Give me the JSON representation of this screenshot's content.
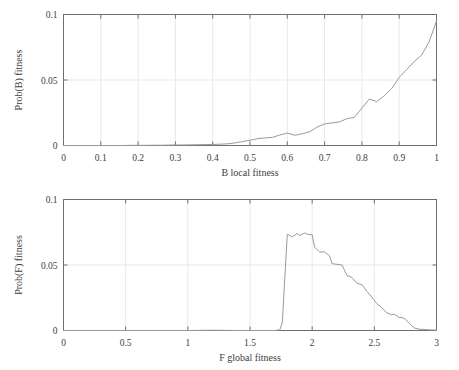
{
  "figure": {
    "background": "#ffffff",
    "line_color": "#9a9a9a",
    "axis_color": "#6f6f6f",
    "grid_color": "#e8e8e8",
    "text_color": "#3d3d3d"
  },
  "chart_data": [
    {
      "type": "line",
      "id": "b-local-fitness",
      "title": "",
      "xlabel": "B local fitness",
      "ylabel": "Prob(B) fitness",
      "xlim": [
        0,
        1
      ],
      "ylim": [
        0,
        0.1
      ],
      "xticks": [
        0,
        0.1,
        0.2,
        0.3,
        0.4,
        0.5,
        0.6,
        0.7,
        0.8,
        0.9,
        1
      ],
      "xticklabels": [
        "0",
        "0.1",
        "0.2",
        "0.3",
        "0.4",
        "0.5",
        "0.6",
        "0.7",
        "0.8",
        "0.9",
        "1"
      ],
      "yticks": [
        0,
        0.05,
        0.1
      ],
      "yticklabels": [
        "0",
        "0.05",
        "0.1"
      ],
      "grid": true,
      "legend": "none",
      "x": [
        0.0,
        0.02,
        0.04,
        0.06,
        0.08,
        0.1,
        0.12,
        0.14,
        0.16,
        0.18,
        0.2,
        0.22,
        0.24,
        0.26,
        0.28,
        0.3,
        0.32,
        0.34,
        0.36,
        0.38,
        0.4,
        0.42,
        0.44,
        0.46,
        0.48,
        0.5,
        0.52,
        0.54,
        0.56,
        0.58,
        0.6,
        0.62,
        0.64,
        0.66,
        0.68,
        0.7,
        0.72,
        0.74,
        0.76,
        0.78,
        0.8,
        0.82,
        0.84,
        0.86,
        0.88,
        0.9,
        0.92,
        0.94,
        0.96,
        0.98,
        1.0
      ],
      "y": [
        0.0,
        0.0,
        0.0,
        0.0,
        0.0,
        0.0,
        0.0,
        0.0,
        0.0,
        0.0001,
        0.0001,
        0.0001,
        0.0002,
        0.0002,
        0.0003,
        0.0004,
        0.0004,
        0.0005,
        0.0006,
        0.0007,
        0.0008,
        0.001,
        0.0013,
        0.002,
        0.003,
        0.004,
        0.0052,
        0.0058,
        0.0062,
        0.008,
        0.0095,
        0.0078,
        0.009,
        0.0105,
        0.014,
        0.0165,
        0.0172,
        0.018,
        0.0205,
        0.0215,
        0.0285,
        0.0355,
        0.0335,
        0.038,
        0.0435,
        0.052,
        0.058,
        0.064,
        0.069,
        0.079,
        0.095
      ]
    },
    {
      "type": "line",
      "id": "f-global-fitness",
      "title": "",
      "xlabel": "F global fitness",
      "ylabel": "Prob(F) fitness",
      "xlim": [
        0,
        3
      ],
      "ylim": [
        0,
        0.1
      ],
      "xticks": [
        0,
        0.5,
        1,
        1.5,
        2,
        2.5,
        3
      ],
      "xticklabels": [
        "0",
        "0.5",
        "1",
        "1.5",
        "2",
        "2.5",
        "3"
      ],
      "yticks": [
        0,
        0.05,
        0.1
      ],
      "yticklabels": [
        "0",
        "0.05",
        "0.1"
      ],
      "grid": true,
      "legend": "none",
      "x": [
        0.0,
        0.2,
        0.4,
        0.6,
        0.8,
        1.0,
        1.2,
        1.4,
        1.6,
        1.7,
        1.74,
        1.76,
        1.78,
        1.8,
        1.84,
        1.88,
        1.9,
        1.94,
        1.96,
        2.0,
        2.02,
        2.06,
        2.1,
        2.14,
        2.16,
        2.2,
        2.24,
        2.28,
        2.32,
        2.36,
        2.4,
        2.44,
        2.48,
        2.52,
        2.56,
        2.6,
        2.64,
        2.66,
        2.7,
        2.74,
        2.78,
        2.82,
        2.86,
        2.9,
        2.94,
        3.0
      ],
      "y": [
        0.0,
        0.0,
        0.0,
        0.0,
        0.0,
        0.0,
        0.0002,
        0.0,
        0.0,
        0.0,
        0.0005,
        0.006,
        0.04,
        0.0735,
        0.0715,
        0.074,
        0.0725,
        0.0745,
        0.0735,
        0.073,
        0.0635,
        0.06,
        0.06,
        0.057,
        0.051,
        0.0505,
        0.05,
        0.042,
        0.0405,
        0.036,
        0.035,
        0.03,
        0.0255,
        0.0205,
        0.0175,
        0.0135,
        0.012,
        0.0125,
        0.01,
        0.0095,
        0.0055,
        0.002,
        0.001,
        0.0008,
        0.0005,
        0.0003
      ]
    }
  ]
}
